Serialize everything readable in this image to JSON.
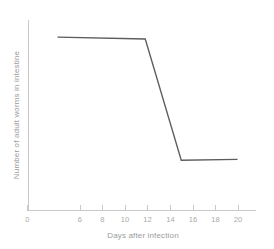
{
  "chart_data": {
    "type": "line",
    "title": "",
    "xlabel": "Days after infection",
    "ylabel": "Number of adult worms in intestine",
    "xlim": [
      0,
      22
    ],
    "ylim": [
      0,
      100
    ],
    "xticks": [
      0,
      6,
      8,
      10,
      12,
      14,
      16,
      18,
      20
    ],
    "xtick_labels": [
      "0",
      "6",
      "8",
      "10",
      "12",
      "14",
      "16",
      "18",
      "20"
    ],
    "yticks": [],
    "ytick_labels": [],
    "grid": false,
    "legend": false,
    "series": [
      {
        "name": "Number of adult worms in intestine",
        "color": "#5d5d5d",
        "x": [
          4.0,
          11.8,
          15.0,
          20.0
        ],
        "values": [
          95.5,
          94.5,
          27.5,
          28.0
        ]
      }
    ],
    "annotations": []
  },
  "axes": {
    "x_axis_name": "x-axis",
    "y_axis_name": "y-axis",
    "x_title": "Days after infection",
    "y_title": "Number of adult worms in intestine",
    "origin_label": "0"
  },
  "colors": {
    "background": "#ffffff",
    "axis": "#c9c9c9",
    "tick_text": "#a9a9a9",
    "title_text": "#9b9b9b",
    "data_line": "#5d5d5d"
  }
}
